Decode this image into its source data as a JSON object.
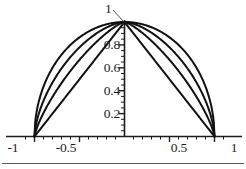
{
  "chart_data": {
    "type": "line",
    "title": "",
    "xlabel": "",
    "ylabel": "",
    "xlim": [
      -1.12,
      1.12
    ],
    "ylim": [
      -0.06,
      1.08
    ],
    "grid": false,
    "legend": null,
    "axis_style": "crossed-axes-at-origin",
    "x_ticks_major": [
      -1,
      -0.5,
      0.5,
      1
    ],
    "x_tick_labels": [
      "-1",
      "-0.5",
      "0.5",
      "1"
    ],
    "x_ticks_minor_step": 0.1,
    "y_ticks_major": [
      0.2,
      0.4,
      0.6,
      0.8
    ],
    "y_tick_labels": [
      "0.2",
      "0.4",
      "0.6",
      "0.8"
    ],
    "y_ticks_minor_step": 0.05,
    "annotations": [
      {
        "text": "1",
        "target_x": 0.0,
        "target_y": 1.0,
        "note": "leader line from label to curve peak at origin-top"
      }
    ],
    "series": [
      {
        "name": "p = 2",
        "formula": "y = (1 - |x|^2)^(1/2)",
        "p": 2,
        "color": "#111111",
        "linewidth": 2,
        "x": [
          -1,
          -0.95,
          -0.9,
          -0.8,
          -0.7,
          -0.6,
          -0.5,
          -0.4,
          -0.3,
          -0.2,
          -0.1,
          0,
          0.1,
          0.2,
          0.3,
          0.4,
          0.5,
          0.6,
          0.7,
          0.8,
          0.9,
          0.95,
          1
        ],
        "y": [
          0,
          0.312,
          0.436,
          0.6,
          0.714,
          0.8,
          0.866,
          0.917,
          0.954,
          0.98,
          0.995,
          1,
          0.995,
          0.98,
          0.954,
          0.917,
          0.866,
          0.8,
          0.714,
          0.6,
          0.436,
          0.312,
          0
        ]
      },
      {
        "name": "p = 1.6",
        "formula": "y = (1 - |x|^1.6)^(1/1.6)",
        "p": 1.6,
        "color": "#111111",
        "linewidth": 2,
        "x": [
          -1,
          -0.95,
          -0.9,
          -0.8,
          -0.7,
          -0.6,
          -0.5,
          -0.4,
          -0.3,
          -0.2,
          -0.1,
          0,
          0.1,
          0.2,
          0.3,
          0.4,
          0.5,
          0.6,
          0.7,
          0.8,
          0.9,
          0.95,
          1
        ],
        "y": [
          0,
          0.213,
          0.327,
          0.489,
          0.612,
          0.711,
          0.79,
          0.854,
          0.905,
          0.945,
          0.976,
          1,
          0.976,
          0.945,
          0.905,
          0.854,
          0.79,
          0.711,
          0.612,
          0.489,
          0.327,
          0.213,
          0
        ]
      },
      {
        "name": "p = 1.3",
        "formula": "y = (1 - |x|^1.3)^(1/1.3)",
        "p": 1.3,
        "color": "#111111",
        "linewidth": 2,
        "x": [
          -1,
          -0.95,
          -0.9,
          -0.8,
          -0.7,
          -0.6,
          -0.5,
          -0.4,
          -0.3,
          -0.2,
          -0.1,
          0,
          0.1,
          0.2,
          0.3,
          0.4,
          0.5,
          0.6,
          0.7,
          0.8,
          0.9,
          0.95,
          1
        ],
        "y": [
          0,
          0.137,
          0.227,
          0.372,
          0.493,
          0.598,
          0.689,
          0.768,
          0.836,
          0.893,
          0.941,
          1,
          0.941,
          0.893,
          0.836,
          0.768,
          0.689,
          0.598,
          0.493,
          0.372,
          0.227,
          0.137,
          0
        ]
      },
      {
        "name": "p = 1",
        "formula": "y = 1 - |x|",
        "p": 1,
        "color": "#111111",
        "linewidth": 2,
        "x": [
          -1,
          -0.95,
          -0.9,
          -0.8,
          -0.7,
          -0.6,
          -0.5,
          -0.4,
          -0.3,
          -0.2,
          -0.1,
          0,
          0.1,
          0.2,
          0.3,
          0.4,
          0.5,
          0.6,
          0.7,
          0.8,
          0.9,
          0.95,
          1
        ],
        "y": [
          0,
          0.05,
          0.1,
          0.2,
          0.3,
          0.4,
          0.5,
          0.6,
          0.7,
          0.8,
          0.9,
          1,
          0.9,
          0.8,
          0.7,
          0.6,
          0.5,
          0.4,
          0.3,
          0.2,
          0.1,
          0.05,
          0
        ]
      }
    ]
  },
  "labels": {
    "peak": "1",
    "y_08": "0.8",
    "y_06": "0.6",
    "y_04": "0.4",
    "y_02": "0.2",
    "x_neg1": "-1",
    "x_neg05": "-0.5",
    "x_pos05": "0.5",
    "x_pos1": "1"
  },
  "colors": {
    "background": "#ffffff",
    "axis": "#1d1d1d",
    "curve": "#111111",
    "text": "#1d1d1d",
    "page_rule": "#5a5a5a"
  }
}
